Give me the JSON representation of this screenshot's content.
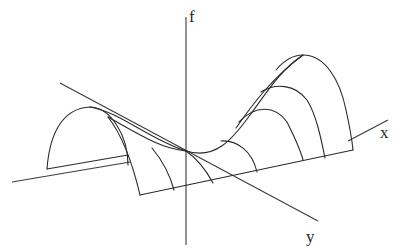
{
  "diagram": {
    "type": "3d-surface-sketch",
    "axes": {
      "f_label": "f",
      "x_label": "x",
      "y_label": "y"
    },
    "colors": {
      "stroke": "#2a2a2a",
      "background": "#ffffff"
    }
  }
}
